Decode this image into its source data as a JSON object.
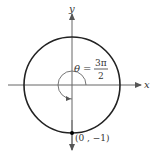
{
  "diagram": {
    "x_axis_label": "x",
    "y_axis_label": "y",
    "angle": {
      "symbol": "θ",
      "equals": "=",
      "numerator": "3π",
      "denominator": "2"
    },
    "point_label": "(0 , −1)",
    "colors": {
      "circle": "#222222",
      "axes": "#555555",
      "point": "#000000"
    }
  }
}
